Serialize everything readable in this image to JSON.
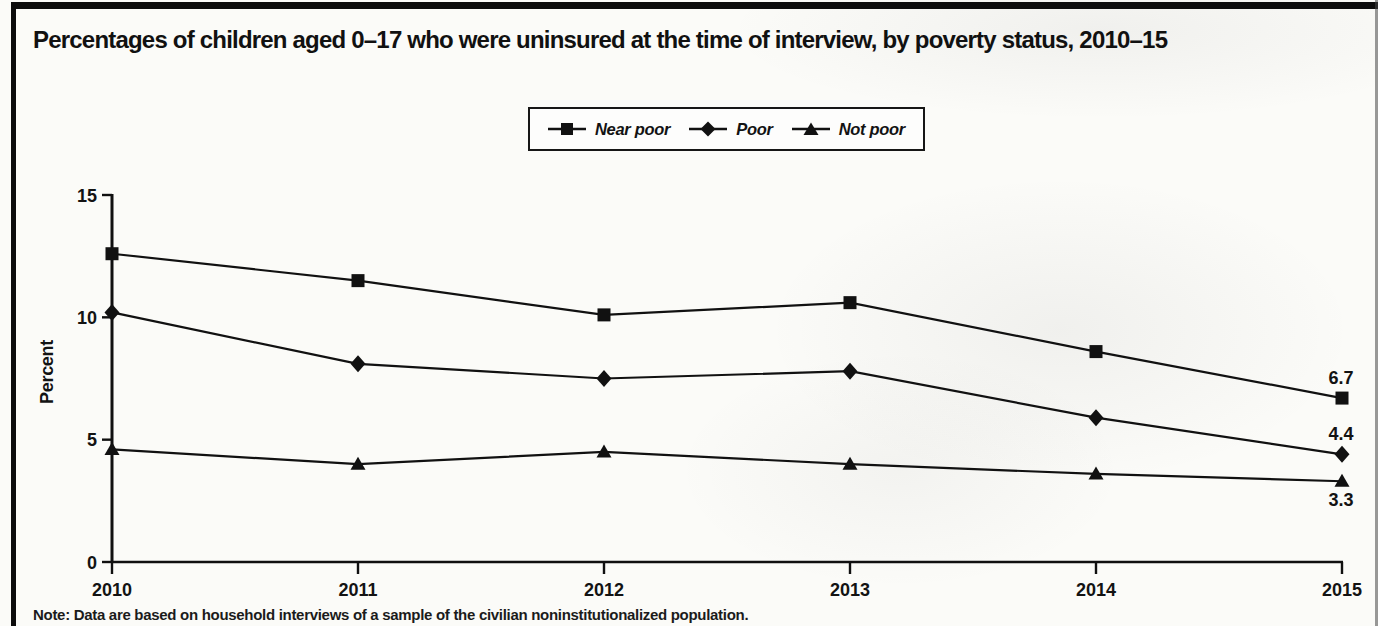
{
  "figure": {
    "note": "Note: Data are based on household interviews of a sample of the civilian noninstitutionalized population."
  },
  "chart_data": {
    "type": "line",
    "title": "Percentages of children aged 0–17 who were uninsured at the time of interview, by poverty status, 2010–15",
    "ylabel": "Percent",
    "xlabel": "",
    "categories": [
      "2010",
      "2011",
      "2012",
      "2013",
      "2014",
      "2015"
    ],
    "yticks": [
      0,
      5,
      10,
      15
    ],
    "ylim": [
      0,
      15
    ],
    "grid": false,
    "legend_position": "top-center",
    "line_color": "#111111",
    "series": [
      {
        "name": "Near poor",
        "marker": "square",
        "values": [
          12.6,
          11.5,
          10.1,
          10.6,
          8.6,
          6.7
        ],
        "end_label": "6.7",
        "end_label_position": "above"
      },
      {
        "name": "Poor",
        "marker": "diamond",
        "values": [
          10.2,
          8.1,
          7.5,
          7.8,
          5.9,
          4.4
        ],
        "end_label": "4.4",
        "end_label_position": "above"
      },
      {
        "name": "Not poor",
        "marker": "triangle",
        "values": [
          4.6,
          4.0,
          4.5,
          4.0,
          3.6,
          3.3
        ],
        "end_label": "3.3",
        "end_label_position": "below"
      }
    ]
  }
}
